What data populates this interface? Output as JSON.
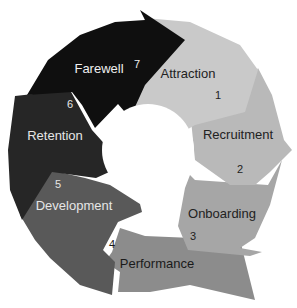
{
  "diagram": {
    "type": "cycle",
    "stages": [
      {
        "number": "1",
        "label": "Attraction",
        "color": "#c9c9c9",
        "text_color": "#222222"
      },
      {
        "number": "2",
        "label": "Recruitment",
        "color": "#b9b9b9",
        "text_color": "#222222"
      },
      {
        "number": "3",
        "label": "Onboarding",
        "color": "#a6a6a6",
        "text_color": "#222222"
      },
      {
        "number": "4",
        "label": "Performance",
        "color": "#8c8c8c",
        "text_color": "#1a1a1a"
      },
      {
        "number": "5",
        "label": "Development",
        "color": "#595959",
        "text_color": "#e6e6e6"
      },
      {
        "number": "6",
        "label": "Retention",
        "color": "#262626",
        "text_color": "#e6e6e6"
      },
      {
        "number": "7",
        "label": "Farewell",
        "color": "#0f0f0f",
        "text_color": "#f0f0f0"
      }
    ],
    "center_fill": "#ffffff"
  }
}
